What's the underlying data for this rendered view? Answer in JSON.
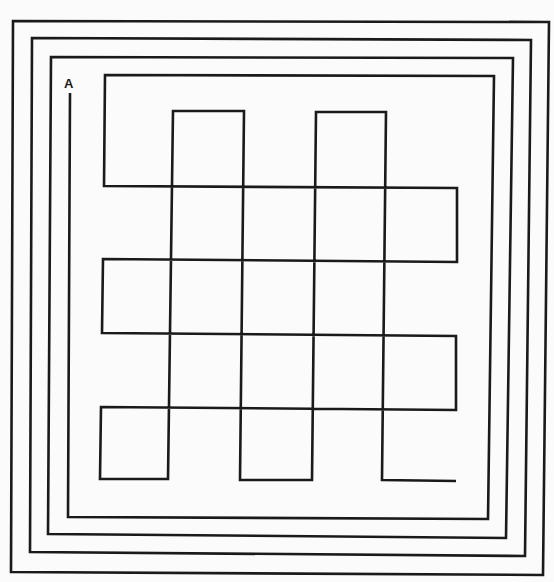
{
  "diagram": {
    "type": "line-maze",
    "start_label": "A",
    "colors": {
      "background": "#fbfbfb",
      "line": "#1a1a1a"
    },
    "outer_rectangles": [
      {
        "name": "outer-rect-1",
        "points": "13,21 549,22 543,575 11,572"
      },
      {
        "name": "outer-rect-2",
        "points": "32,38 531,40 525,556 30,552"
      },
      {
        "name": "outer-rect-3",
        "points": "51,57 513,58 506,538 48,534"
      }
    ],
    "path": {
      "name": "spiral-weave-path",
      "start": [
        70,
        93
      ],
      "points": "70,93 68,517 488,519 494,76 105,75 104,186 457,188 457,262 103,259 102,333 456,336 456,410 101,407 100,479 168,479 173,111 244,111 240,480 312,480 316,112 386,112 382,480 456,481",
      "end": [
        456,
        481
      ]
    }
  }
}
